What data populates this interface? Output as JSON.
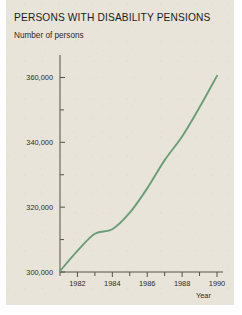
{
  "chart_data": {
    "type": "line",
    "title": "PERSONS WITH DISABILITY PENSIONS",
    "subtitle": "Number of persons",
    "ylabel": "Number of persons",
    "xlabel": "Year",
    "xlim": [
      1981,
      1990
    ],
    "ylim": [
      300000,
      362000
    ],
    "grid": false,
    "legend": null,
    "y_ticks_major": [
      300000,
      320000,
      340000,
      360000
    ],
    "y_tick_labels": [
      "300,000",
      "320,000",
      "340,000",
      "360,000"
    ],
    "y_ticks_minor": [
      310000,
      330000,
      350000
    ],
    "x_ticks_major": [
      1982,
      1984,
      1986,
      1988,
      1990
    ],
    "x_tick_labels": [
      "1982",
      "1984",
      "1986",
      "1988",
      "1990"
    ],
    "x_ticks_minor": [
      1981,
      1983,
      1985,
      1987,
      1989
    ],
    "series": [
      {
        "name": "Persons with disability pensions",
        "color": "#6b9e78",
        "x": [
          1981,
          1982,
          1983,
          1984,
          1985,
          1986,
          1987,
          1988,
          1989,
          1990
        ],
        "values": [
          300300,
          306500,
          311800,
          313200,
          318300,
          325800,
          334500,
          341800,
          350800,
          360500
        ]
      }
    ]
  },
  "figure": {
    "background_color": "#e9e4d9",
    "axis_color": "#55514a",
    "text_color": "#1b1b1b",
    "line_color": "#6b9e78"
  }
}
